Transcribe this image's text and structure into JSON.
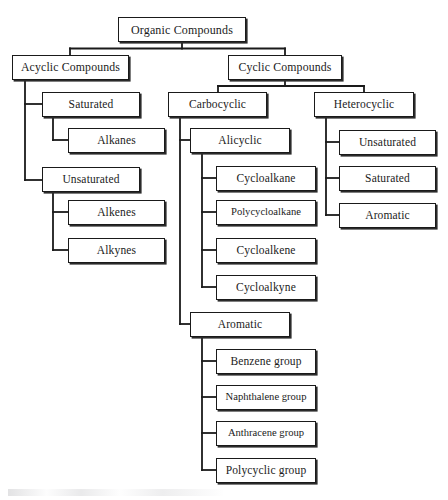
{
  "diagram": {
    "line_color": "#1a1a1a",
    "box_border_color": "#1a1a1a",
    "box_fill_color": "#ffffff",
    "shadow_color": "#2b2b2b",
    "text_color": "#1b1b1b",
    "background_color": "#ffffff"
  },
  "nodes": {
    "root": "Organic Compounds",
    "acyclic": "Acyclic Compounds",
    "cyclic": "Cyclic Compounds",
    "acyclic_saturated": "Saturated",
    "alkanes": "Alkanes",
    "acyclic_unsaturated": "Unsaturated",
    "alkenes": "Alkenes",
    "alkynes": "Alkynes",
    "carbocyclic": "Carbocyclic",
    "alicyclic": "Alicyclic",
    "cycloalkane": "Cycloalkane",
    "polycycloalkane": "Polycycloalkane",
    "cycloalkene": "Cycloalkene",
    "cycloalkyne": "Cycloalkyne",
    "carbocyclic_aromatic": "Aromatic",
    "benzene_group": "Benzene group",
    "naphthalene_group": "Naphthalene group",
    "anthracene_group": "Anthracene group",
    "polycyclic_group": "Polycyclic group",
    "heterocyclic": "Heterocyclic",
    "hetero_unsaturated": "Unsaturated",
    "hetero_saturated": "Saturated",
    "hetero_aromatic": "Aromatic"
  },
  "tree": {
    "label": "Organic Compounds",
    "children": [
      {
        "label": "Acyclic Compounds",
        "children": [
          {
            "label": "Saturated",
            "children": [
              {
                "label": "Alkanes"
              }
            ]
          },
          {
            "label": "Unsaturated",
            "children": [
              {
                "label": "Alkenes"
              },
              {
                "label": "Alkynes"
              }
            ]
          }
        ]
      },
      {
        "label": "Cyclic Compounds",
        "children": [
          {
            "label": "Carbocyclic",
            "children": [
              {
                "label": "Alicyclic",
                "children": [
                  {
                    "label": "Cycloalkane"
                  },
                  {
                    "label": "Polycycloalkane"
                  },
                  {
                    "label": "Cycloalkene"
                  },
                  {
                    "label": "Cycloalkyne"
                  }
                ]
              },
              {
                "label": "Aromatic",
                "children": [
                  {
                    "label": "Benzene group"
                  },
                  {
                    "label": "Naphthalene group"
                  },
                  {
                    "label": "Anthracene group"
                  },
                  {
                    "label": "Polycyclic group"
                  }
                ]
              }
            ]
          },
          {
            "label": "Heterocyclic",
            "children": [
              {
                "label": "Unsaturated"
              },
              {
                "label": "Saturated"
              },
              {
                "label": "Aromatic"
              }
            ]
          }
        ]
      }
    ]
  }
}
